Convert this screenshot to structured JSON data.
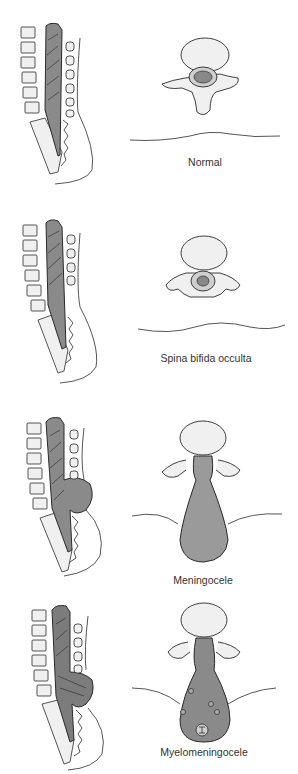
{
  "figure": {
    "panels": [
      {
        "id": "normal",
        "caption": "Normal"
      },
      {
        "id": "spina-bifida-occulta",
        "caption": "Spina bifida occulta"
      },
      {
        "id": "meningocele",
        "caption": "Meningocele"
      },
      {
        "id": "myelomeningocele",
        "caption": "Myelomeningocele"
      }
    ],
    "colors": {
      "line": "#2a2a2a",
      "cord_fill": "#8a8a8a",
      "sac_fill": "#9a9a9a",
      "bone_fill": "#f0f0f0",
      "background": "#ffffff"
    }
  }
}
